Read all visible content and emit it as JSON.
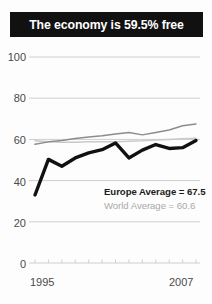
{
  "banner": {
    "text": "The economy is 59.5% free"
  },
  "legend": {
    "europe": "Europe Average = 67.5",
    "world": "World Average = 60.6"
  },
  "axis": {
    "y_ticks": [
      "100",
      "80",
      "60",
      "40",
      "20",
      "0"
    ],
    "x_start": "1995",
    "x_end": "2007"
  },
  "colors": {
    "banner_bg": "#111111",
    "banner_text": "#ffffff",
    "country_line": "#111111",
    "europe_line": "#8c8c8c",
    "world_line": "#c9c9c9",
    "gridline": "#cfcfcf",
    "tick_label": "#4a4a4a"
  },
  "chart_data": {
    "type": "line",
    "title": "The economy is 59.5% free",
    "xlabel": "",
    "ylabel": "",
    "ylim": [
      0,
      100
    ],
    "xlim": [
      1995,
      2007
    ],
    "grid": true,
    "gridlines_y": [
      0,
      20,
      40,
      60,
      80,
      100
    ],
    "legend_position": "inside-right",
    "x": [
      1995,
      1996,
      1997,
      1998,
      1999,
      2000,
      2001,
      2002,
      2003,
      2004,
      2005,
      2006,
      2007
    ],
    "series": [
      {
        "name": "Country",
        "color": "#111111",
        "width": "thick",
        "label": "",
        "values": [
          33.0,
          50.3,
          47.0,
          51.0,
          53.5,
          55.0,
          58.3,
          51.0,
          54.8,
          57.5,
          55.6,
          56.0,
          59.5
        ]
      },
      {
        "name": "Europe Average",
        "color": "#8c8c8c",
        "width": "thin",
        "label": "Europe Average = 67.5",
        "values": [
          57.6,
          58.8,
          59.5,
          60.4,
          61.2,
          61.8,
          62.6,
          63.3,
          62.2,
          63.4,
          64.6,
          66.6,
          67.5
        ]
      },
      {
        "name": "World Average",
        "color": "#c9c9c9",
        "width": "thin",
        "label": "World Average = 60.6",
        "values": [
          59.4,
          58.8,
          58.6,
          58.6,
          58.8,
          58.8,
          58.9,
          59.1,
          59.3,
          59.7,
          60.0,
          60.3,
          60.6
        ]
      }
    ]
  }
}
